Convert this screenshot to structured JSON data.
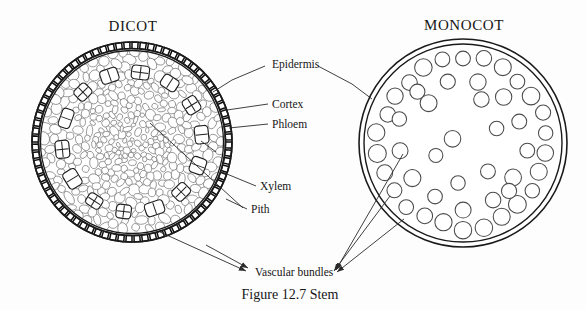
{
  "figure": {
    "caption": "Figure 12.7    Stem",
    "caption_number": "12.7",
    "caption_title": "Stem"
  },
  "panels": [
    {
      "id": "dicot",
      "heading": "DICOT",
      "heading_x": 133,
      "heading_y": 31,
      "center": {
        "x": 132,
        "y": 142
      },
      "radius": 100
    },
    {
      "id": "monocot",
      "heading": "MONOCOT",
      "heading_x": 464,
      "heading_y": 30,
      "center": {
        "x": 463,
        "y": 143
      },
      "radius": 104
    }
  ],
  "labels": [
    {
      "key": "epidermis",
      "text": "Epidermis",
      "x": 272,
      "y": 68,
      "anchor": "start"
    },
    {
      "key": "cortex",
      "text": "Cortex",
      "x": 272,
      "y": 108,
      "anchor": "start"
    },
    {
      "key": "phloem",
      "text": "Phloem",
      "x": 272,
      "y": 128,
      "anchor": "start"
    },
    {
      "key": "xylem",
      "text": "Xylem",
      "x": 260,
      "y": 190,
      "anchor": "start"
    },
    {
      "key": "pith",
      "text": "Pith",
      "x": 251,
      "y": 213,
      "anchor": "start"
    },
    {
      "key": "vascular_bundles",
      "text": "Vascular bundles",
      "x": 255,
      "y": 276,
      "anchor": "start"
    }
  ],
  "colors": {
    "background": "#fdfdfd",
    "ink": "#161616",
    "outline": "#1a1a1a",
    "ground_tissue": "#6d6d6d",
    "leader": "#2a2a2a"
  },
  "structure_notes": {
    "dicot_bundle_count": 14,
    "dicot_epidermis_cells": 76,
    "monocot_outer_bundle_count": 26,
    "monocot_inner_bundle_count": 8
  }
}
